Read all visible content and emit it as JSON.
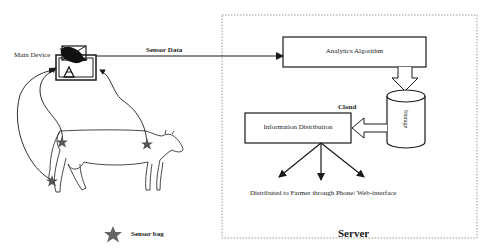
{
  "diagram": {
    "main_device": {
      "label": "Main Device",
      "icon": "satellite-dish-icon"
    },
    "sensor_data": {
      "label": "Sensor Data"
    },
    "server": {
      "title": "Server",
      "analytics": {
        "label": "Analytics Algorithm"
      },
      "storage": {
        "label": "Storage"
      },
      "cloud": {
        "label": "Cloud"
      },
      "distribution": {
        "label": "Information Distribution"
      },
      "output": {
        "label": "Distributed to Farmer through Phone/ Web-interface"
      }
    },
    "legend": {
      "icon": "star-icon",
      "label": "Sensor bag"
    },
    "colors": {
      "line": "#1a1a1a",
      "server_border": "#9a9a9a",
      "star": "#555555",
      "background": "#ffffff"
    }
  }
}
